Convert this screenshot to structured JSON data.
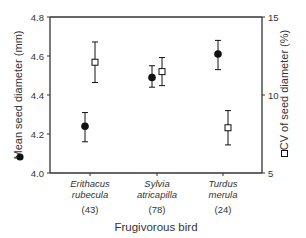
{
  "chart_data": {
    "type": "scatter",
    "title": "",
    "xlabel": "Frugivorous bird",
    "ylabel_left": "Mean seed diameter (mm)",
    "ylabel_right": "CV of seed diameter (%)",
    "ylim_left": [
      4.0,
      4.8
    ],
    "ylim_right": [
      5,
      15
    ],
    "yticks_left": [
      "4.0",
      "4.2",
      "4.4",
      "4.6",
      "4.8"
    ],
    "yticks_right": [
      "5",
      "10",
      "15"
    ],
    "categories": [
      {
        "genus": "Erithacus",
        "species": "rubecula",
        "n": "(43)"
      },
      {
        "genus": "Sylvia",
        "species": "atricapilla",
        "n": "(78)"
      },
      {
        "genus": "Turdus",
        "species": "merula",
        "n": "(24)"
      }
    ],
    "series": [
      {
        "name": "Mean seed diameter (mm)",
        "marker": "filled-circle",
        "axis": "left",
        "values": [
          4.24,
          4.49,
          4.61
        ],
        "err_low": [
          4.16,
          4.44,
          4.53
        ],
        "err_high": [
          4.31,
          4.55,
          4.68
        ]
      },
      {
        "name": "CV of seed diameter (%)",
        "marker": "open-square",
        "axis": "right",
        "values": [
          12.1,
          11.5,
          7.9
        ],
        "err_low": [
          10.8,
          10.6,
          6.8
        ],
        "err_high": [
          13.4,
          12.4,
          9.0
        ]
      }
    ],
    "grid": false,
    "legend": "markers embedded in axis labels"
  },
  "colors": {
    "axis": "#333333",
    "marker": "#111111",
    "text": "#333333"
  }
}
